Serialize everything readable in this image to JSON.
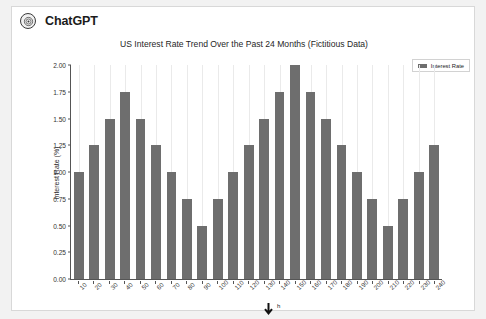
{
  "header": {
    "brand": "ChatGPT",
    "logo_icon": "openai-logo-icon"
  },
  "legend": {
    "label": "Interest Rate",
    "position": "top-right"
  },
  "cursor": {
    "icon": "down-arrow-cursor-icon",
    "hint": "h"
  },
  "chart_data": {
    "type": "bar",
    "title": "US Interest Rate Trend Over the Past 24 Months (Fictitious Data)",
    "xlabel": "",
    "ylabel": "Interest Rate (%)",
    "categories": [
      "10",
      "20",
      "30",
      "40",
      "50",
      "60",
      "70",
      "80",
      "90",
      "100",
      "110",
      "120",
      "130",
      "140",
      "150",
      "160",
      "170",
      "180",
      "190",
      "200",
      "210",
      "220",
      "230",
      "240"
    ],
    "values": [
      1.0,
      1.25,
      1.5,
      1.75,
      1.5,
      1.25,
      1.0,
      0.75,
      0.5,
      0.75,
      1.0,
      1.25,
      1.5,
      1.75,
      2.0,
      1.75,
      1.5,
      1.25,
      1.0,
      0.75,
      0.5,
      0.75,
      1.0,
      1.25
    ],
    "series": [
      {
        "name": "Interest Rate",
        "values": [
          1.0,
          1.25,
          1.5,
          1.75,
          1.5,
          1.25,
          1.0,
          0.75,
          0.5,
          0.75,
          1.0,
          1.25,
          1.5,
          1.75,
          2.0,
          1.75,
          1.5,
          1.25,
          1.0,
          0.75,
          0.5,
          0.75,
          1.0,
          1.25
        ],
        "color": "#6e6e6e"
      }
    ],
    "ylim": [
      0.0,
      2.0
    ],
    "yticks": [
      "0.00",
      "0.25",
      "0.50",
      "0.75",
      "1.00",
      "1.25",
      "1.50",
      "1.75",
      "2.00"
    ],
    "ytick_values": [
      0.0,
      0.25,
      0.5,
      0.75,
      1.0,
      1.25,
      1.5,
      1.75,
      2.0
    ],
    "grid": "vertical-only",
    "legend_position": "upper right",
    "bar_color": "#6e6e6e"
  }
}
